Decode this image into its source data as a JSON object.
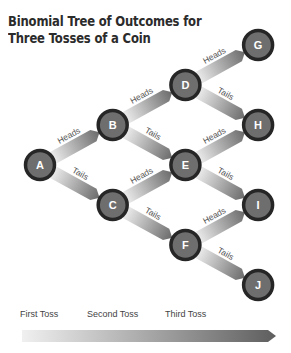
{
  "header": {
    "remnant": "",
    "title_line1": "Binomial Tree of Outcomes for",
    "title_line2": "Three Tosses of a Coin"
  },
  "nodes": [
    {
      "id": "A",
      "level": 0,
      "row": 3
    },
    {
      "id": "B",
      "level": 1,
      "row": 2
    },
    {
      "id": "C",
      "level": 1,
      "row": 4
    },
    {
      "id": "D",
      "level": 2,
      "row": 1
    },
    {
      "id": "E",
      "level": 2,
      "row": 3
    },
    {
      "id": "F",
      "level": 2,
      "row": 5
    },
    {
      "id": "G",
      "level": 3,
      "row": 0
    },
    {
      "id": "H",
      "level": 3,
      "row": 2
    },
    {
      "id": "I",
      "level": 3,
      "row": 4
    },
    {
      "id": "J",
      "level": 3,
      "row": 6
    }
  ],
  "edges": [
    {
      "from": "A",
      "to": "B",
      "label": "Heads"
    },
    {
      "from": "A",
      "to": "C",
      "label": "Tails"
    },
    {
      "from": "B",
      "to": "D",
      "label": "Heads"
    },
    {
      "from": "B",
      "to": "E",
      "label": "Tails"
    },
    {
      "from": "C",
      "to": "E",
      "label": "Heads"
    },
    {
      "from": "C",
      "to": "F",
      "label": "Tails"
    },
    {
      "from": "D",
      "to": "G",
      "label": "Heads"
    },
    {
      "from": "D",
      "to": "H",
      "label": "Tails"
    },
    {
      "from": "E",
      "to": "H",
      "label": "Heads"
    },
    {
      "from": "E",
      "to": "I",
      "label": "Tails"
    },
    {
      "from": "F",
      "to": "I",
      "label": "Heads"
    },
    {
      "from": "F",
      "to": "J",
      "label": "Tails"
    }
  ],
  "timeline": {
    "labels": [
      "First Toss",
      "Second Toss",
      "Third Toss"
    ]
  },
  "colors": {
    "node_fill": "#6e6e6e",
    "node_ring": "#262626",
    "node_text": "#ffffff",
    "band_light": "#f2f2f2",
    "band_dark": "#6a6a6a",
    "edge_label": "#555555"
  }
}
